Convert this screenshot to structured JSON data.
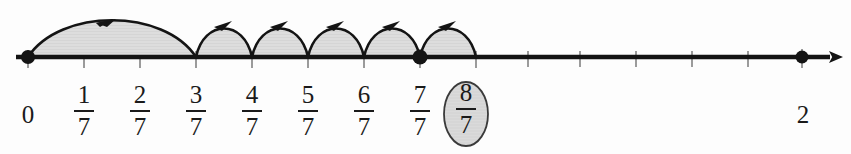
{
  "figure": {
    "type": "number-line",
    "axis": {
      "start_value": 0,
      "end_value": 2,
      "arrow_direction": "right",
      "origin_px": 28,
      "unit_px": 392,
      "step_px": 56,
      "axis_y_px": 57
    },
    "colors": {
      "ink": "#1a1a1a",
      "arc_fill": "#dcdcdc",
      "arc_stroke": "#141414",
      "highlight_fill": "#d9d9d9",
      "highlight_stroke": "#2a2a2a",
      "background": "#fdfdfd",
      "tick": "#9a9a9a"
    }
  },
  "labels": [
    {
      "id": "label-0",
      "text": "0",
      "kind": "integer",
      "value": 0,
      "x_px": 28
    },
    {
      "id": "label-1-7",
      "numerator": "1",
      "denominator": "7",
      "kind": "fraction",
      "value": 0.142857,
      "x_px": 84
    },
    {
      "id": "label-2-7",
      "numerator": "2",
      "denominator": "7",
      "kind": "fraction",
      "value": 0.285714,
      "x_px": 140
    },
    {
      "id": "label-3-7",
      "numerator": "3",
      "denominator": "7",
      "kind": "fraction",
      "value": 0.428571,
      "x_px": 196
    },
    {
      "id": "label-4-7",
      "numerator": "4",
      "denominator": "7",
      "kind": "fraction",
      "value": 0.571429,
      "x_px": 252
    },
    {
      "id": "label-5-7",
      "numerator": "5",
      "denominator": "7",
      "kind": "fraction",
      "value": 0.714286,
      "x_px": 308
    },
    {
      "id": "label-6-7",
      "numerator": "6",
      "denominator": "7",
      "kind": "fraction",
      "value": 0.857143,
      "x_px": 364
    },
    {
      "id": "label-7-7",
      "numerator": "7",
      "denominator": "7",
      "kind": "fraction",
      "value": 1.0,
      "x_px": 420
    },
    {
      "id": "label-8-7",
      "numerator": "8",
      "denominator": "7",
      "kind": "fraction",
      "value": 1.142857,
      "x_px": 476,
      "highlighted": true
    },
    {
      "id": "label-2",
      "text": "2",
      "kind": "integer",
      "value": 2,
      "x_px": 803
    }
  ],
  "ticks_px": [
    28,
    84,
    140,
    196,
    252,
    308,
    364,
    420,
    476,
    528,
    580,
    636,
    692,
    748,
    802
  ],
  "points": [
    {
      "id": "point-0",
      "label": "0",
      "x_px": 28,
      "filled": true
    },
    {
      "id": "point-7-7",
      "label": "7/7",
      "x_px": 420,
      "filled": true
    },
    {
      "id": "point-2",
      "label": "2",
      "x_px": 802,
      "filled": true
    }
  ],
  "arcs": [
    {
      "id": "arc-0-to-3-7",
      "from": "0",
      "to": "3/7",
      "x1_px": 28,
      "x2_px": 196,
      "height_px": 40,
      "arrow": "right"
    },
    {
      "id": "arc-3-7-to-4-7",
      "from": "3/7",
      "to": "4/7",
      "x1_px": 196,
      "x2_px": 252,
      "height_px": 38,
      "arrow": "right"
    },
    {
      "id": "arc-4-7-to-5-7",
      "from": "4/7",
      "to": "5/7",
      "x1_px": 252,
      "x2_px": 308,
      "height_px": 38,
      "arrow": "right"
    },
    {
      "id": "arc-5-7-to-6-7",
      "from": "5/7",
      "to": "6/7",
      "x1_px": 308,
      "x2_px": 364,
      "height_px": 38,
      "arrow": "right"
    },
    {
      "id": "arc-6-7-to-7-7",
      "from": "6/7",
      "to": "7/7",
      "x1_px": 364,
      "x2_px": 420,
      "height_px": 38,
      "arrow": "right"
    },
    {
      "id": "arc-7-7-to-8-7",
      "from": "7/7",
      "to": "8/7",
      "x1_px": 420,
      "x2_px": 476,
      "height_px": 38,
      "arrow": "right"
    }
  ],
  "highlight": {
    "target": "8/7",
    "shape": "ellipse",
    "cx_px": 466,
    "cy_px": 114,
    "rx_px": 22,
    "ry_px": 32
  }
}
